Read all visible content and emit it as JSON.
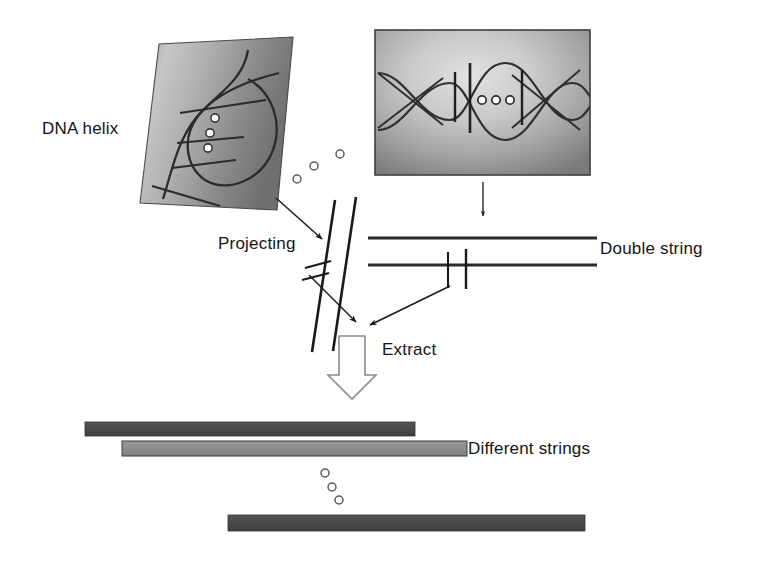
{
  "figure": {
    "width": 757,
    "height": 561,
    "background_color": "#ffffff"
  },
  "labels": {
    "dna_helix": "DNA helix",
    "projecting": "Projecting",
    "double_string": "Double string",
    "extract": "Extract",
    "different_strings": "Different strings"
  },
  "colors": {
    "ink": "#141414",
    "stroke": "#1a1a1a",
    "panel_dark": "#6d6d6d",
    "panel_mid": "#9a9a9a",
    "panel_light": "#d8d8d8",
    "panel_border": "#4a4a4a",
    "bar_dark": "#4c4c4c",
    "bar_light": "#8e8e8e",
    "bar_outline": "#3a3a3a",
    "hollow_arrow_fill": "#ffffff",
    "hollow_arrow_stroke": "#8c8c8c",
    "circle_stroke": "#555555",
    "circle_fill": "#ffffff"
  },
  "panels": [
    {
      "name": "dna-helix-panel",
      "shape": "parallelogram",
      "tilted": true,
      "points": "159,44 293,37 277,210 140,203",
      "gradient": "light-left-to-dark-right",
      "circle_count": 3,
      "rung_count": 3
    },
    {
      "name": "double-helix-panel",
      "shape": "rectangle",
      "x": 375,
      "y": 30,
      "width": 215,
      "height": 145,
      "gradient": "light-center-to-dark-edges",
      "circle_count": 3,
      "bar_count": 3
    }
  ],
  "shapes": {
    "free_circles_upper": [
      {
        "cx": 297,
        "cy": 179,
        "r": 4
      },
      {
        "cx": 314,
        "cy": 166,
        "r": 4
      },
      {
        "cx": 340,
        "cy": 154,
        "r": 4
      }
    ],
    "free_circles_lower": [
      {
        "cx": 325,
        "cy": 473,
        "r": 4
      },
      {
        "cx": 332,
        "cy": 487,
        "r": 4
      },
      {
        "cx": 339,
        "cy": 500,
        "r": 4
      }
    ],
    "projected_strands": [
      {
        "x1": 334,
        "y1": 201,
        "x2": 313,
        "y2": 350
      },
      {
        "x1": 354,
        "y1": 198,
        "x2": 332,
        "y2": 352
      }
    ],
    "strand_ticks": [
      {
        "x1": 305,
        "y1": 267,
        "x2": 330,
        "y2": 261
      },
      {
        "x1": 302,
        "y1": 279,
        "x2": 328,
        "y2": 273
      }
    ],
    "double_string_lines": [
      {
        "x1": 368,
        "y1": 238,
        "x2": 597,
        "y2": 238
      },
      {
        "x1": 368,
        "y1": 265,
        "x2": 597,
        "y2": 265
      }
    ],
    "double_string_ticks": [
      {
        "x": 448,
        "y1": 252,
        "y2": 287
      },
      {
        "x": 466,
        "y1": 249,
        "y2": 288
      }
    ],
    "arrows": [
      {
        "name": "projecting-arrow",
        "x1": 278,
        "y1": 200,
        "x2": 325,
        "y2": 241
      },
      {
        "name": "panel-to-double-string-arrow",
        "x1": 483,
        "y1": 182,
        "x2": 483,
        "y2": 218
      },
      {
        "name": "strand-to-extract-arrow",
        "x1": 310,
        "y1": 276,
        "x2": 358,
        "y2": 323
      },
      {
        "name": "double-string-to-extract-arrow",
        "x1": 450,
        "y1": 286,
        "x2": 370,
        "y2": 326
      }
    ],
    "hollow_arrow": {
      "name": "extract-block-arrow",
      "center_x": 352,
      "top_y": 336,
      "bottom_y": 399,
      "shaft_width": 26,
      "head_width": 48
    },
    "result_bars": [
      {
        "name": "string-bar-1",
        "x": 85,
        "y": 422,
        "width": 330,
        "height": 14,
        "color": "#4c4c4c"
      },
      {
        "name": "string-bar-2",
        "x": 122,
        "y": 441,
        "width": 345,
        "height": 15,
        "color": "#8e8e8e"
      },
      {
        "name": "string-bar-3",
        "x": 228,
        "y": 515,
        "width": 357,
        "height": 16,
        "color": "#4c4c4c"
      }
    ]
  }
}
